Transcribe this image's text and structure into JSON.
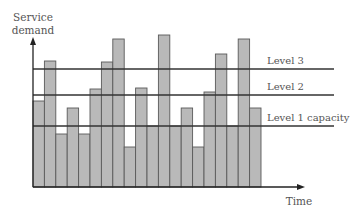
{
  "chart_data": {
    "type": "bar",
    "title": "",
    "xlabel": "Time",
    "ylabel": "Service demand",
    "ylabel_lines": [
      "Service",
      "demand"
    ],
    "categories": [
      "t1",
      "t2",
      "t3",
      "t4",
      "t5",
      "t6",
      "t7",
      "t8",
      "t9",
      "t10",
      "t11",
      "t12",
      "t13",
      "t14",
      "t15",
      "t16",
      "t17",
      "t18",
      "t19",
      "t20"
    ],
    "values": [
      86,
      126,
      53,
      79,
      53,
      98,
      125,
      148,
      40,
      99,
      61,
      152,
      61,
      79,
      40,
      95,
      133,
      61,
      148,
      79
    ],
    "ylim": [
      0,
      160
    ],
    "grid": false,
    "tick_labels_shown": false,
    "reference_lines": [
      {
        "label": "Level 3",
        "value": 118
      },
      {
        "label": "Level 2",
        "value": 92
      },
      {
        "label": "Level 1 capacity",
        "value": 61
      }
    ],
    "colors": {
      "bar_fill": "#b9b9b9",
      "bar_edge": "#5a5a5a",
      "axis": "#222222",
      "reference_line": "#333333",
      "text": "#555555"
    },
    "units_note": "values are relative heights (no numeric axis shown)"
  }
}
